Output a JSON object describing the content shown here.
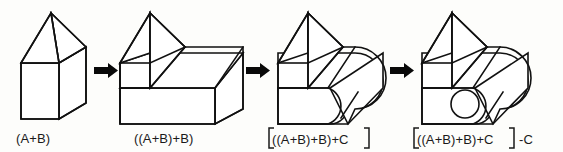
{
  "figure": {
    "background_color": "#fdfdfb",
    "line_color": "#111111",
    "face_color": "#ffffff",
    "arrow_color": "#090909",
    "text_color": "#1a1a1a",
    "step_count": 4,
    "arrow_count": 3
  },
  "steps": [
    {
      "index": 1,
      "name": "step-prism-plus-block",
      "caption": "(A+B)",
      "caption_plain": "(A+B)",
      "has_bracket": false,
      "suffix": "",
      "shape": "house-prism-on-box",
      "operation": "union"
    },
    {
      "index": 2,
      "name": "step-added-second-block",
      "caption": "((A+B)+B)",
      "caption_plain": "((A+B)+B)",
      "has_bracket": false,
      "suffix": "",
      "shape": "stepped-solid-with-prism",
      "operation": "union"
    },
    {
      "index": 3,
      "name": "step-added-cylinder",
      "caption": "((A+B)+B)+C",
      "caption_plain": "[((A+B)+B)+C]",
      "has_bracket": true,
      "suffix": "",
      "shape": "stepped-solid-with-rounded-cylinder",
      "operation": "union"
    },
    {
      "index": 4,
      "name": "step-subtracted-cylinder",
      "caption": "((A+B)+B)+C",
      "caption_plain": "[((A+B)+B)+C] -C",
      "has_bracket": true,
      "suffix": "-C",
      "shape": "stepped-solid-with-hole",
      "operation": "difference"
    }
  ],
  "arrows": [
    {
      "name": "arrow-1",
      "from_step": 1,
      "to_step": 2,
      "glyph": "right-arrow"
    },
    {
      "name": "arrow-2",
      "from_step": 2,
      "to_step": 3,
      "glyph": "right-arrow"
    },
    {
      "name": "arrow-3",
      "from_step": 3,
      "to_step": 4,
      "glyph": "right-arrow"
    }
  ]
}
